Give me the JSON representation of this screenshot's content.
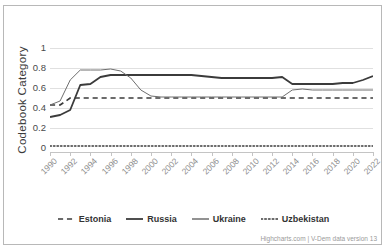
{
  "chart_title": "",
  "credits": "Highcharts.com | V-Dem data version 13",
  "axes": {
    "y_title": "Codebook Category",
    "y_ticks": [
      "0",
      "0.2",
      "0.4",
      "0.6",
      "0.8",
      "1"
    ],
    "x_ticks": [
      "1990",
      "1992",
      "1994",
      "1996",
      "1998",
      "2000",
      "2002",
      "2004",
      "2006",
      "2008",
      "2010",
      "2012",
      "2014",
      "2016",
      "2018",
      "2020",
      "2022"
    ]
  },
  "legend": [
    {
      "label": "Estonia",
      "dash": "dashed",
      "width": 1.6,
      "color": "#3b3b3b"
    },
    {
      "label": "Russia",
      "dash": "solid",
      "width": 1.8,
      "color": "#3b3b3b"
    },
    {
      "label": "Ukraine",
      "dash": "solid",
      "width": 1.0,
      "color": "#6e6e6e"
    },
    {
      "label": "Uzbekistan",
      "dash": "dotted",
      "width": 1.4,
      "color": "#3b3b3b"
    }
  ],
  "chart_data": {
    "type": "line",
    "title": "",
    "xlabel": "",
    "ylabel": "Codebook Category",
    "ylim": [
      0,
      1
    ],
    "xlim": [
      1990,
      2022
    ],
    "grid": true,
    "legend_position": "bottom",
    "x": [
      1990,
      1991,
      1992,
      1993,
      1994,
      1995,
      1996,
      1997,
      1998,
      1999,
      2000,
      2001,
      2002,
      2003,
      2004,
      2005,
      2006,
      2007,
      2008,
      2009,
      2010,
      2011,
      2012,
      2013,
      2014,
      2015,
      2016,
      2017,
      2018,
      2019,
      2020,
      2021,
      2022
    ],
    "series": [
      {
        "name": "Estonia",
        "color": "#3b3b3b",
        "dash": "dashed",
        "width": 1.6,
        "values": [
          0.43,
          0.43,
          0.5,
          0.5,
          0.5,
          0.5,
          0.5,
          0.5,
          0.5,
          0.5,
          0.5,
          0.5,
          0.5,
          0.5,
          0.5,
          0.5,
          0.5,
          0.5,
          0.5,
          0.5,
          0.5,
          0.5,
          0.5,
          0.5,
          0.5,
          0.5,
          0.5,
          0.5,
          0.5,
          0.5,
          0.5,
          0.5,
          0.5
        ]
      },
      {
        "name": "Russia",
        "color": "#3b3b3b",
        "dash": "solid",
        "width": 1.8,
        "values": [
          0.31,
          0.33,
          0.38,
          0.63,
          0.64,
          0.71,
          0.73,
          0.73,
          0.73,
          0.73,
          0.73,
          0.73,
          0.73,
          0.73,
          0.73,
          0.72,
          0.71,
          0.7,
          0.7,
          0.7,
          0.7,
          0.7,
          0.7,
          0.71,
          0.64,
          0.64,
          0.64,
          0.64,
          0.64,
          0.65,
          0.65,
          0.68,
          0.72
        ]
      },
      {
        "name": "Ukraine",
        "color": "#6e6e6e",
        "dash": "solid",
        "width": 1.0,
        "values": [
          0.43,
          0.47,
          0.68,
          0.78,
          0.78,
          0.78,
          0.79,
          0.77,
          0.7,
          0.58,
          0.52,
          0.51,
          0.51,
          0.51,
          0.51,
          0.51,
          0.51,
          0.51,
          0.51,
          0.51,
          0.51,
          0.51,
          0.51,
          0.51,
          0.58,
          0.59,
          0.58,
          0.58,
          0.58,
          0.58,
          0.58,
          0.58,
          0.58
        ]
      },
      {
        "name": "Uzbekistan",
        "color": "#3b3b3b",
        "dash": "dotted",
        "width": 1.4,
        "values": [
          0.02,
          0.02,
          0.02,
          0.02,
          0.02,
          0.02,
          0.02,
          0.02,
          0.02,
          0.02,
          0.02,
          0.02,
          0.02,
          0.02,
          0.02,
          0.02,
          0.02,
          0.02,
          0.02,
          0.02,
          0.02,
          0.02,
          0.02,
          0.02,
          0.02,
          0.02,
          0.02,
          0.02,
          0.02,
          0.02,
          0.02,
          0.02,
          0.02
        ]
      }
    ],
    "russia_detail": [
      {
        "year": 1990,
        "v": 0.31
      },
      {
        "year": 1991,
        "v": 0.33
      },
      {
        "year": 1992,
        "v": 0.38
      },
      {
        "year": 1993,
        "v": 0.63
      },
      {
        "year": 1994,
        "v": 0.64
      },
      {
        "year": 1995,
        "v": 0.71
      },
      {
        "year": 1996,
        "v": 0.73
      },
      {
        "year": 2004,
        "v": 0.73
      },
      {
        "year": 2005,
        "v": 0.71
      },
      {
        "year": 2009,
        "v": 0.7
      },
      {
        "year": 2013,
        "v": 0.71
      },
      {
        "year": 2014,
        "v": 0.64
      },
      {
        "year": 2019,
        "v": 0.65
      },
      {
        "year": 2020,
        "v": 0.68
      },
      {
        "year": 2021,
        "v": 0.75
      },
      {
        "year": 2022,
        "v": 0.72
      }
    ]
  }
}
